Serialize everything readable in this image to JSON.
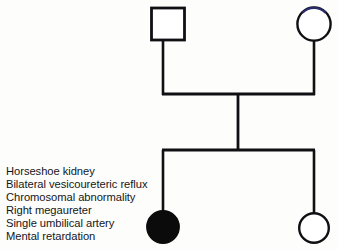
{
  "diagram": {
    "type": "pedigree-chart",
    "generations": 2,
    "background_color": "#fdfdfb",
    "stroke_color": "#101014",
    "fill_affected_color": "#0b0b0c",
    "fill_unaffected_color": "#ffffff",
    "circle_top_tint": "#2b2b6b",
    "stroke_width": 2.6,
    "symbols": [
      {
        "id": "father",
        "shape": "square",
        "sex": "male",
        "affected": false,
        "generation": 1,
        "cx": 168,
        "cy": 24,
        "size": 33
      },
      {
        "id": "mother",
        "shape": "circle",
        "sex": "female",
        "affected": false,
        "generation": 1,
        "cx": 314,
        "cy": 24,
        "r": 17
      },
      {
        "id": "affected-daughter",
        "shape": "circle",
        "sex": "female",
        "affected": true,
        "generation": 2,
        "cx": 163,
        "cy": 227,
        "r": 16
      },
      {
        "id": "unaffected-daughter",
        "shape": "circle",
        "sex": "female",
        "affected": false,
        "generation": 2,
        "cx": 314,
        "cy": 228,
        "r": 15
      }
    ],
    "connectors": [
      {
        "id": "father-descender",
        "x1": 163,
        "y1": 41,
        "x2": 163,
        "y2": 95
      },
      {
        "id": "mother-descender",
        "x1": 314,
        "y1": 41,
        "x2": 314,
        "y2": 95
      },
      {
        "id": "mating-line",
        "x1": 163,
        "y1": 94,
        "x2": 314,
        "y2": 94
      },
      {
        "id": "sibship-descender",
        "x1": 238,
        "y1": 94,
        "x2": 238,
        "y2": 151
      },
      {
        "id": "sibship-line",
        "x1": 163,
        "y1": 150,
        "x2": 314,
        "y2": 150
      },
      {
        "id": "child-left-descender",
        "x1": 163,
        "y1": 150,
        "x2": 163,
        "y2": 211
      },
      {
        "id": "child-right-descender",
        "x1": 314,
        "y1": 150,
        "x2": 314,
        "y2": 213
      }
    ]
  },
  "findings": {
    "items": [
      "Horseshoe kidney",
      "Bilateral vesicoureteric reflux",
      "Chromosomal abnormality",
      "Right megaureter",
      "Single umbilical artery",
      "Mental retardation"
    ]
  }
}
